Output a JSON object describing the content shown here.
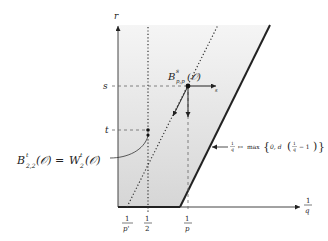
{
  "diagram": {
    "axes": {
      "vertical_label": "r",
      "horizontal_label_num": "1",
      "horizontal_label_den": "q"
    },
    "ticks_y": [
      {
        "label": "s"
      },
      {
        "label": "t"
      }
    ],
    "ticks_x": [
      {
        "num": "1",
        "den": "p'"
      },
      {
        "num": "1",
        "den": "2"
      },
      {
        "num": "1",
        "den": "p"
      }
    ],
    "point_label": {
      "base": "B",
      "sup": "s",
      "sub": "p,p",
      "arg": "(𝒪)"
    },
    "arrow_label": "s",
    "left_annotation": {
      "lhs_base": "B",
      "lhs_sup": "t",
      "lhs_sub": "2,2",
      "lhs_arg": "(𝒪) = ",
      "rhs_base": "W",
      "rhs_sup": "t",
      "rhs_sub": "2",
      "rhs_arg": "(𝒪)"
    },
    "boundary_annotation": {
      "map_lhs_num": "1",
      "map_lhs_den": "q",
      "mapsto": "↦",
      "max_text": "max",
      "brace_open": "{",
      "inner": "0, d",
      "paren_open": "(",
      "frac_num": "1",
      "frac_den": "q",
      "minus_one": " − 1",
      "paren_close": ")",
      "brace_close": "}"
    },
    "colors": {
      "shade_top": "#f4f4f4",
      "shade_bottom": "#d9d9d9",
      "line": "#222222"
    }
  }
}
